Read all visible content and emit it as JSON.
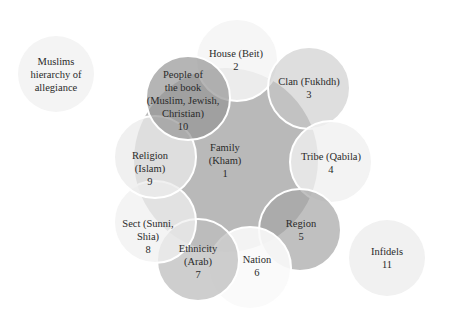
{
  "title": "Muslims hierarchy of allegiance",
  "title_lines": [
    "Muslims",
    "hierarchy of",
    "allegiance"
  ],
  "nodes": [
    {
      "id": "family",
      "name": "Family (Kham)",
      "lines": [
        "Family",
        "(Kham)",
        "1"
      ],
      "rank": 1
    },
    {
      "id": "house",
      "name": "House (Beit)",
      "lines": [
        "House (Beit)",
        "2"
      ],
      "rank": 2
    },
    {
      "id": "clan",
      "name": "Clan (Fukhdh)",
      "lines": [
        "Clan (Fukhdh)",
        "3"
      ],
      "rank": 3
    },
    {
      "id": "tribe",
      "name": "Tribe (Qabila)",
      "lines": [
        "Tribe (Qabila)",
        "4"
      ],
      "rank": 4
    },
    {
      "id": "region",
      "name": "Region",
      "lines": [
        "Region",
        "5"
      ],
      "rank": 5
    },
    {
      "id": "nation",
      "name": "Nation",
      "lines": [
        "Nation",
        "6"
      ],
      "rank": 6
    },
    {
      "id": "ethnicity",
      "name": "Ethnicity (Arab)",
      "lines": [
        "Ethnicity",
        "(Arab)",
        "7"
      ],
      "rank": 7
    },
    {
      "id": "sect",
      "name": "Sect (Sunni, Shia)",
      "lines": [
        "Sect (Sunni,",
        "Shia)",
        "8"
      ],
      "rank": 8
    },
    {
      "id": "religion",
      "name": "Religion (Islam)",
      "lines": [
        "Religion",
        "(Islam)",
        "9"
      ],
      "rank": 9
    },
    {
      "id": "people-of-the-book",
      "name": "People of the book (Muslim, Jewish, Christian)",
      "lines": [
        "People of",
        "the book",
        "(Muslim, Jewish,",
        "Christian)",
        "10"
      ],
      "rank": 10
    },
    {
      "id": "infidels",
      "name": "Infidels",
      "lines": [
        "Infidels",
        "11"
      ],
      "rank": 11
    }
  ],
  "colors": {
    "family": "#b9b9b9",
    "house": "#f1f1f1",
    "clan": "#d6d6d6",
    "tribe": "#ececec",
    "region": "#b4b4b4",
    "nation": "#f6f6f6",
    "ethnicity": "#c4c4c4",
    "sect": "#efefef",
    "religion": "#e4e4e4",
    "people_of_the_book": "#a4a4a4",
    "title_circle": "#f4f4f4",
    "infidels": "#f1f1f1",
    "text": "#2a2a2a"
  }
}
